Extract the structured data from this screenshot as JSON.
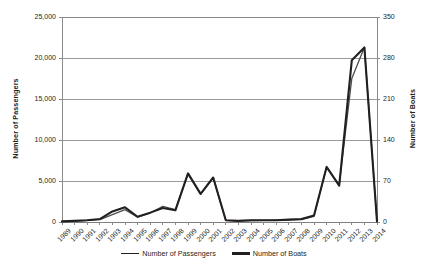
{
  "chart_data": {
    "type": "line",
    "title": "",
    "xlabel": "",
    "categories": [
      "1989",
      "1990",
      "1991",
      "1992",
      "1993",
      "1994",
      "1995",
      "1996",
      "1997",
      "1998",
      "1999",
      "2000",
      "2001",
      "2002",
      "2003",
      "2004",
      "2005",
      "2006",
      "2007",
      "2008",
      "2009",
      "2010",
      "2011",
      "2012",
      "2013",
      "2014"
    ],
    "grid": true,
    "legend_position": "bottom",
    "axes": {
      "left": {
        "label": "Number of Passengers",
        "ticks": [
          "0",
          "5,000",
          "10,000",
          "15,000",
          "20,000",
          "25,000"
        ],
        "tick_values": [
          0,
          5000,
          10000,
          15000,
          20000,
          25000
        ],
        "min": 0,
        "max": 25000
      },
      "right": {
        "label": "Number of Boats",
        "ticks": [
          "0",
          "70",
          "140",
          "210",
          "280",
          "350"
        ],
        "tick_values": [
          0,
          70,
          140,
          210,
          280,
          350
        ],
        "min": 0,
        "max": 350
      }
    },
    "series": [
      {
        "name": "Number of Passengers",
        "axis": "left",
        "color": "#4d4d4d",
        "width": 1.3,
        "values": [
          60,
          120,
          200,
          300,
          900,
          1500,
          600,
          1100,
          1900,
          1500,
          5900,
          3400,
          5400,
          200,
          150,
          180,
          200,
          220,
          260,
          300,
          700,
          6700,
          4500,
          17500,
          21300,
          60
        ]
      },
      {
        "name": "Number of Boats",
        "axis": "right",
        "color": "#231f20",
        "width": 2.1,
        "values": [
          1,
          2,
          3,
          5,
          18,
          25,
          9,
          16,
          24,
          20,
          83,
          48,
          76,
          3,
          2,
          3,
          3,
          3,
          4,
          5,
          11,
          94,
          62,
          276,
          298,
          1
        ]
      }
    ]
  },
  "legend": {
    "entries": [
      {
        "label": "Number of Passengers",
        "style": "thin"
      },
      {
        "label": "Number of Boats",
        "style": "thick"
      }
    ]
  }
}
